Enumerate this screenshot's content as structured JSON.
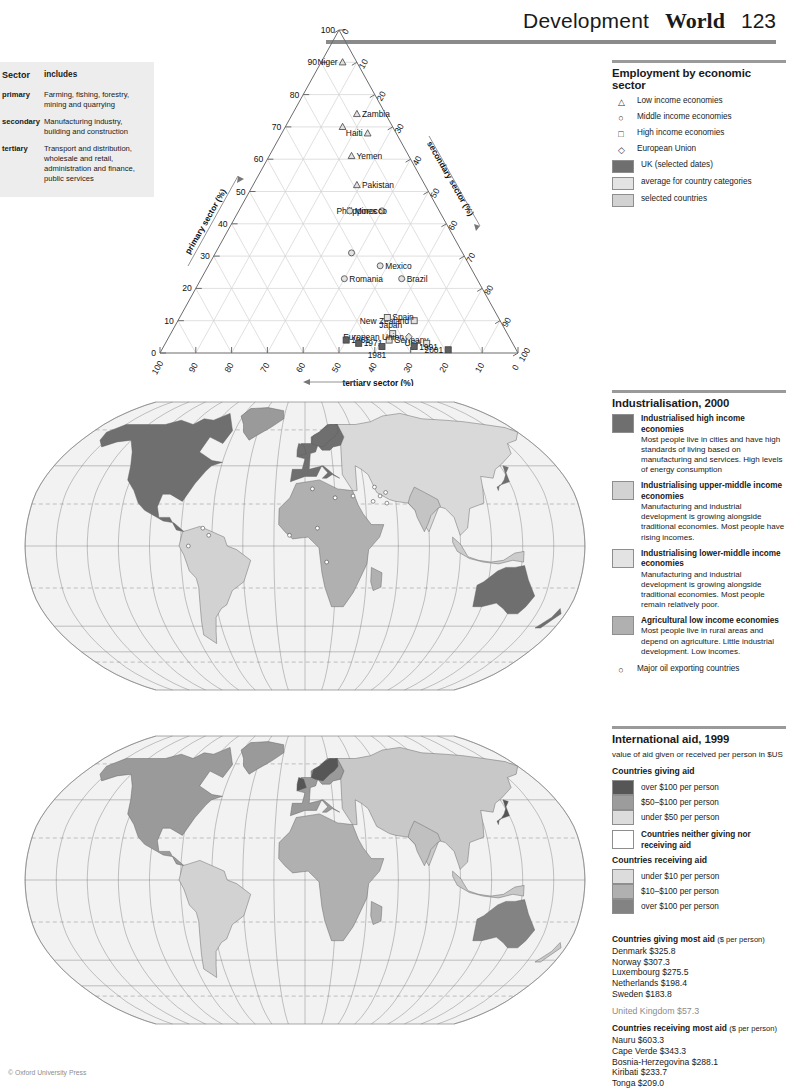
{
  "header": {
    "section": "Development",
    "title": "World",
    "page": "123"
  },
  "footer": {
    "copyright": "© Oxford University Press"
  },
  "sector_table": {
    "col1": "Sector",
    "col2": "includes",
    "rows": [
      {
        "sector": "primary",
        "includes": "Farming, fishing, forestry, mining and quarrying"
      },
      {
        "sector": "secondary",
        "includes": "Manufacturing industry, building and construction"
      },
      {
        "sector": "tertiary",
        "includes": "Transport and distribution, wholesale and retail, administration and finance, public services"
      }
    ]
  },
  "employment_legend": {
    "title": "Employment by economic sector",
    "symbol_items": [
      {
        "symbol": "triangle",
        "label": "Low income economies"
      },
      {
        "symbol": "circle",
        "label": "Middle income economies"
      },
      {
        "symbol": "square",
        "label": "High income economies"
      },
      {
        "symbol": "diamond",
        "label": "European Union"
      }
    ],
    "swatch_items": [
      {
        "color": "#6f6f6f",
        "label": "UK (selected dates)"
      },
      {
        "color": "#e3e3e3",
        "label": "average for country categories"
      },
      {
        "color": "#d2d2d2",
        "label": "selected countries"
      }
    ]
  },
  "chart_data": {
    "type": "scatter",
    "title": "Employment by economic sector",
    "subtype": "ternary",
    "axes": {
      "left": {
        "label": "primary sector (%)",
        "ticks": [
          0,
          10,
          20,
          30,
          40,
          50,
          60,
          70,
          80,
          90,
          100
        ]
      },
      "right": {
        "label": "secondary sector (%)",
        "ticks": [
          0,
          10,
          20,
          30,
          40,
          50,
          60,
          70,
          80,
          90,
          100
        ]
      },
      "bottom": {
        "label": "tertiary sector (%)",
        "ticks": [
          100,
          90,
          80,
          70,
          60,
          50,
          40,
          30,
          20,
          10,
          0
        ]
      }
    },
    "points": [
      {
        "name": "Niger",
        "primary": 90,
        "secondary": 4,
        "tertiary": 6,
        "group": "low",
        "label_pos": "left"
      },
      {
        "name": "Zambia",
        "primary": 74,
        "secondary": 8,
        "tertiary": 18,
        "group": "low",
        "label_pos": "right"
      },
      {
        "name": "",
        "primary": 70,
        "secondary": 14,
        "tertiary": 16,
        "group": "low",
        "label_pos": "none"
      },
      {
        "name": "Haiti",
        "primary": 68,
        "secondary": 8,
        "tertiary": 24,
        "group": "low",
        "label_pos": "left"
      },
      {
        "name": "Yemen",
        "primary": 61,
        "secondary": 16,
        "tertiary": 23,
        "group": "low",
        "label_pos": "right"
      },
      {
        "name": "Pakistan",
        "primary": 52,
        "secondary": 19,
        "tertiary": 29,
        "group": "low",
        "label_pos": "right"
      },
      {
        "name": "Philippines",
        "primary": 44,
        "secondary": 16,
        "tertiary": 40,
        "group": "middle",
        "label_pos": "left"
      },
      {
        "name": "Morocco",
        "primary": 44,
        "secondary": 25,
        "tertiary": 31,
        "group": "middle",
        "label_pos": "right"
      },
      {
        "name": "",
        "primary": 31,
        "secondary": 31,
        "tertiary": 38,
        "group": "middle",
        "label_pos": "none"
      },
      {
        "name": "Mexico",
        "primary": 27,
        "secondary": 25,
        "tertiary": 48,
        "group": "middle",
        "label_pos": "right"
      },
      {
        "name": "Brazil",
        "primary": 23,
        "secondary": 21,
        "tertiary": 56,
        "group": "middle",
        "label_pos": "right"
      },
      {
        "name": "Romania",
        "primary": 23,
        "secondary": 37,
        "tertiary": 40,
        "group": "middle",
        "label_pos": "right"
      },
      {
        "name": "New Zealand",
        "primary": 10,
        "secondary": 24,
        "tertiary": 66,
        "group": "high",
        "label_pos": "left"
      },
      {
        "name": "Spain",
        "primary": 11,
        "secondary": 31,
        "tertiary": 58,
        "group": "high",
        "label_pos": "right"
      },
      {
        "name": "Japan",
        "primary": 6,
        "secondary": 32,
        "tertiary": 62,
        "group": "high",
        "label_pos": "above"
      },
      {
        "name": "Germany",
        "primary": 4,
        "secondary": 34,
        "tertiary": 62,
        "group": "high",
        "label_pos": "right"
      },
      {
        "name": "European Union",
        "primary": 5,
        "secondary": 28,
        "tertiary": 67,
        "group": "eu",
        "label_pos": "left"
      },
      {
        "name": "USA",
        "primary": 3,
        "secondary": 24,
        "tertiary": 73,
        "group": "high",
        "label_pos": "left"
      }
    ],
    "uk_series": [
      {
        "year": "1961",
        "primary": 4,
        "secondary": 46,
        "tertiary": 50
      },
      {
        "year": "1971",
        "primary": 3,
        "secondary": 43,
        "tertiary": 54
      },
      {
        "year": "1981",
        "primary": 2,
        "secondary": 37,
        "tertiary": 61
      },
      {
        "year": "1991",
        "primary": 2,
        "secondary": 28,
        "tertiary": 70
      },
      {
        "year": "2001",
        "primary": 1,
        "secondary": 19,
        "tertiary": 80
      }
    ]
  },
  "industrialisation": {
    "title": "Industrialisation, 2000",
    "items": [
      {
        "color": "#6f6f6f",
        "title": "Industrialised high income economies",
        "desc": "Most people live in cities and have high standards of living based on manufacturing and services. High levels of energy consumption"
      },
      {
        "color": "#d2d2d2",
        "title": "Industrialising upper-middle income economies",
        "desc": "Manufacturing and industrial development is growing alongside traditional economies. Most people have rising incomes."
      },
      {
        "color": "#e3e3e3",
        "title": "Industrialising lower-middle income economies",
        "desc": "Manufacturing and industrial development is growing alongside traditional economies. Most people remain relatively poor."
      },
      {
        "color": "#b0b0b0",
        "title": "Agricultural low income economies",
        "desc": "Most people live in rural areas and depend on agriculture. Little industrial development. Low incomes."
      }
    ],
    "oil_symbol_label": "Major oil exporting countries"
  },
  "aid": {
    "title": "International aid, 1999",
    "subtitle": "value of aid given or received per person in $US",
    "giving_heading": "Countries giving aid",
    "giving": [
      {
        "color": "#565656",
        "label": "over $100 per person"
      },
      {
        "color": "#9c9c9c",
        "label": "$50–$100 per person"
      },
      {
        "color": "#dcdcdc",
        "label": "under $50 per person"
      }
    ],
    "neither": {
      "color": "#ffffff",
      "label": "Countries neither giving nor receiving aid"
    },
    "receiving_heading": "Countries receiving aid",
    "receiving": [
      {
        "color": "#dcdcdc",
        "label": "under $10 per person"
      },
      {
        "color": "#b0b0b0",
        "label": "$10–$100 per person"
      },
      {
        "color": "#838383",
        "label": "over $100 per person"
      }
    ]
  },
  "stats": {
    "giving_title": "Countries giving most aid",
    "giving_unit": "($ per person)",
    "giving": [
      "Denmark $325.8",
      "Norway $307.3",
      "Luxembourg $275.5",
      "Netherlands $198.4",
      "Sweden $183.8"
    ],
    "uk": "United Kingdom $57.3",
    "receiving_title": "Countries receiving most aid",
    "receiving_unit": "($ per person)",
    "receiving": [
      "Nauru $603.3",
      "Cape Verde $343.3",
      "Bosnia-Herzegovina $288.1",
      "Kiribati $233.7",
      "Tonga $209.0"
    ]
  }
}
